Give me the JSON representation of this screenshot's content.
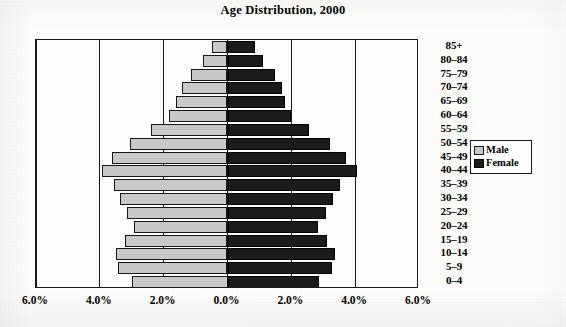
{
  "chart_data": {
    "type": "bar",
    "subtype": "population-pyramid",
    "title": "Age Distribution, 2000",
    "xlabel": "",
    "ylabel": "",
    "orientation": "horizontal",
    "grid": true,
    "legend_position": "right",
    "xlim": [
      -6.0,
      6.0
    ],
    "xtick_values": [
      -6.0,
      -4.0,
      -2.0,
      0.0,
      2.0,
      4.0,
      6.0
    ],
    "xtick_labels": [
      "6.0%",
      "4.0%",
      "2.0%",
      "0.0%",
      "2.0%",
      "4.0%",
      "6.0%"
    ],
    "categories": [
      "0–4",
      "5–9",
      "10–14",
      "15–19",
      "20–24",
      "25–29",
      "30–34",
      "35–39",
      "40–44",
      "45–49",
      "50–54",
      "55–59",
      "60–64",
      "65–69",
      "70–74",
      "75–79",
      "80–84",
      "85+"
    ],
    "series": [
      {
        "name": "Male",
        "color": "#c9c9c9",
        "values": [
          3.0,
          3.42,
          3.5,
          3.22,
          2.92,
          3.15,
          3.38,
          3.56,
          3.94,
          3.62,
          3.05,
          2.4,
          1.82,
          1.6,
          1.42,
          1.15,
          0.78,
          0.5
        ]
      },
      {
        "name": "Female",
        "color": "#1b1b1b",
        "values": [
          2.88,
          3.28,
          3.36,
          3.12,
          2.85,
          3.08,
          3.32,
          3.52,
          4.05,
          3.72,
          3.2,
          2.55,
          2.0,
          1.8,
          1.72,
          1.48,
          1.1,
          0.85
        ]
      }
    ]
  },
  "legend": {
    "items": [
      {
        "label": "Male",
        "swatch": "male"
      },
      {
        "label": "Female",
        "swatch": "female"
      }
    ]
  }
}
